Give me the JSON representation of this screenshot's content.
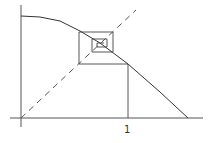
{
  "diagram": {
    "type": "cobweb-plot",
    "x_axis": {
      "tick_labels": [
        {
          "text": "1",
          "x": 128
        }
      ]
    },
    "colors": {
      "line": "#444444",
      "background": "#ffffff"
    },
    "curve_points": [
      [
        21,
        16
      ],
      [
        40,
        17
      ],
      [
        60,
        21
      ],
      [
        80,
        31
      ],
      [
        100,
        43
      ],
      [
        128,
        64
      ],
      [
        160,
        92
      ],
      [
        188,
        118
      ]
    ],
    "cobweb": [
      [
        128,
        118
      ],
      [
        128,
        64
      ],
      [
        79,
        64
      ],
      [
        79,
        32
      ],
      [
        113,
        32
      ],
      [
        113,
        52
      ],
      [
        92,
        52
      ],
      [
        92,
        39
      ],
      [
        107,
        39
      ],
      [
        107,
        47
      ],
      [
        97,
        47
      ],
      [
        97,
        43
      ],
      [
        104,
        43
      ]
    ]
  }
}
